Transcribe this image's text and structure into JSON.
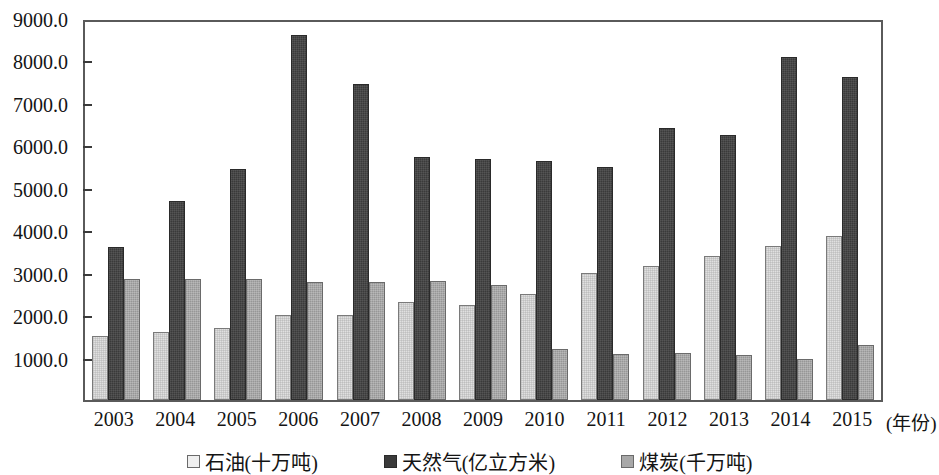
{
  "chart_data": {
    "type": "bar",
    "title": "",
    "subtitle": "",
    "xlabel": "(年份)",
    "ylabel": "",
    "ylim": [
      0,
      9000
    ],
    "ytick_step": 1000,
    "grid": false,
    "legend_position": "bottom",
    "categories": [
      "2003",
      "2004",
      "2005",
      "2006",
      "2007",
      "2008",
      "2009",
      "2010",
      "2011",
      "2012",
      "2013",
      "2014",
      "2015"
    ],
    "ytick_labels": [
      "9000.0",
      "8000.0",
      "7000.0",
      "6000.0",
      "5000.0",
      "4000.0",
      "3000.0",
      "2000.0",
      "1000.0"
    ],
    "ytick_values": [
      9000,
      8000,
      7000,
      6000,
      5000,
      4000,
      3000,
      2000,
      1000
    ],
    "series": [
      {
        "name": "石油(十万吨)",
        "key": "oil",
        "color": "#e0e0e0",
        "values": [
          1500,
          1600,
          1700,
          2000,
          2000,
          2300,
          2250,
          2500,
          3000,
          3150,
          3400,
          3630,
          3860
        ]
      },
      {
        "name": "天然气(亿立方米)",
        "key": "gas",
        "color": "#3a3a3a",
        "values": [
          3600,
          4700,
          5450,
          8600,
          7450,
          5720,
          5670,
          5630,
          5480,
          6400,
          6250,
          8080,
          7600
        ]
      },
      {
        "name": "煤炭(千万吨)",
        "key": "coal",
        "color": "#a8a8a8",
        "values": [
          2860,
          2860,
          2850,
          2780,
          2780,
          2800,
          2700,
          1210,
          1090,
          1100,
          1050,
          970,
          1290
        ]
      }
    ]
  }
}
